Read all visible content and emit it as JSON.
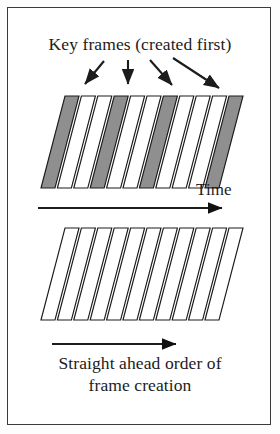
{
  "figure": {
    "kind": "line-drawing-diagram",
    "background_color": "#ffffff",
    "border_color": "#3a3a3a",
    "ink_color": "#1c1c1c",
    "keyframe_fill_color": "#8f8f8f",
    "inbetween_fill_color": "#ffffff"
  },
  "title": {
    "text": "Key frames (created first)"
  },
  "axis": {
    "time_label": "Time"
  },
  "caption": {
    "line1": "Straight ahead order of",
    "line2": "frame creation"
  },
  "top_stack": {
    "name": "key-frame-stack",
    "frame_count": 11,
    "key_frame_indices": [
      0,
      3,
      6,
      10
    ],
    "shaded": true,
    "geometry": {
      "x_start": 41,
      "x_step": 16.4,
      "skew_dx": 24,
      "panel_width": 14,
      "panel_height": 68,
      "top_y": 96,
      "bottom_y": 188
    },
    "callout_arrows": [
      {
        "name": "arrow-to-keyframe-1",
        "x1": 104,
        "y1": 61,
        "x2": 85,
        "y2": 84
      },
      {
        "name": "arrow-to-keyframe-2",
        "x1": 128,
        "y1": 60,
        "x2": 128,
        "y2": 84
      },
      {
        "name": "arrow-to-keyframe-3",
        "x1": 150,
        "y1": 60,
        "x2": 172,
        "y2": 85
      },
      {
        "name": "arrow-to-keyframe-4",
        "x1": 173,
        "y1": 58,
        "x2": 219,
        "y2": 88
      }
    ]
  },
  "bottom_stack": {
    "name": "straight-ahead-frame-stack",
    "frame_count": 11,
    "key_frame_indices": [],
    "shaded": false,
    "geometry": {
      "x_start": 41,
      "x_step": 16.4,
      "skew_dx": 24,
      "panel_width": 14,
      "panel_height": 68,
      "top_y": 228,
      "bottom_y": 320
    }
  },
  "time_arrow": {
    "name": "time-arrow",
    "x1": 38,
    "x2": 222,
    "y": 208
  },
  "order_arrow": {
    "name": "frame-order-arrow",
    "x1": 52,
    "x2": 176,
    "y": 344
  }
}
